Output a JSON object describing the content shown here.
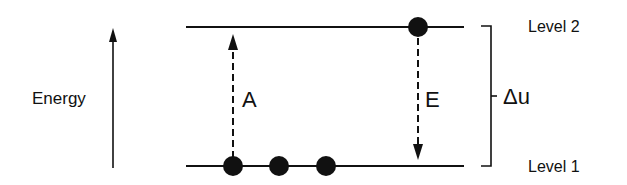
{
  "diagram": {
    "axis_label": "Energy",
    "levels": [
      {
        "id": "level-2",
        "label": "Level 2"
      },
      {
        "id": "level-1",
        "label": "Level 1"
      }
    ],
    "transitions": [
      {
        "id": "absorption",
        "label": "A",
        "direction": "up"
      },
      {
        "id": "emission",
        "label": "E",
        "direction": "down"
      }
    ],
    "gap_label": "Δu",
    "particles": {
      "level_1_count": 3,
      "level_2_count": 1
    },
    "colors": {
      "ink": "#111111",
      "background": "#ffffff"
    }
  }
}
